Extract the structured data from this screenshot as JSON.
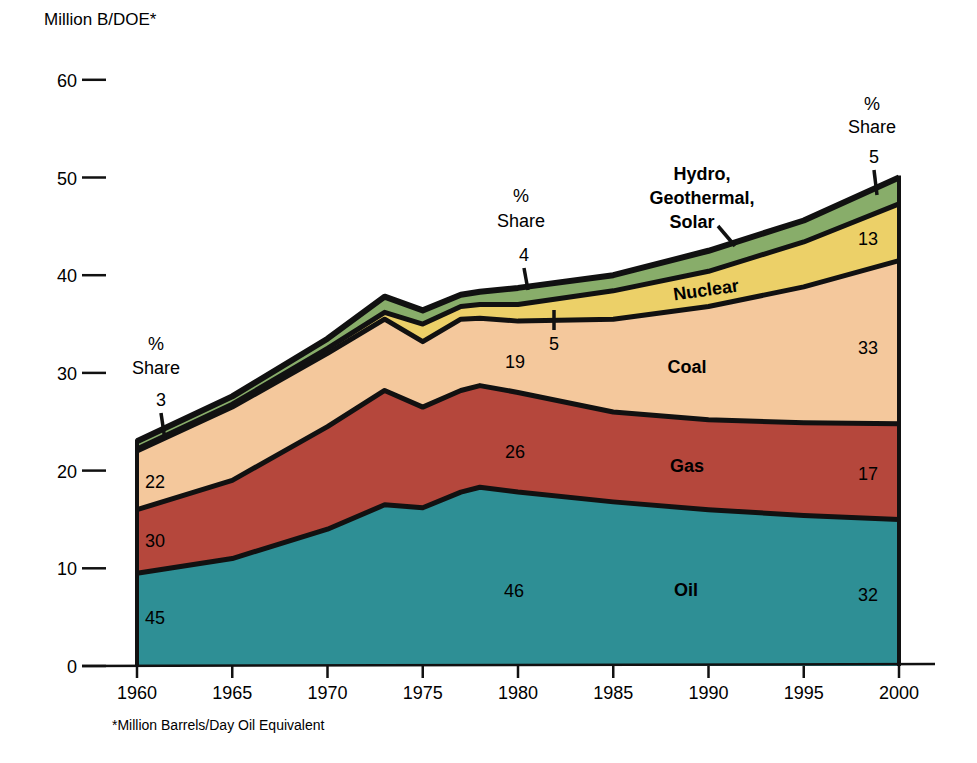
{
  "chart_data": {
    "type": "area",
    "stacked": true,
    "title": "",
    "ylabel": "Million B/DOE*",
    "xlabel": "",
    "footnote": "*Million Barrels/Day Oil Equivalent",
    "xlim": [
      1960,
      2000
    ],
    "ylim": [
      0,
      60
    ],
    "x_ticks": [
      1960,
      1965,
      1970,
      1975,
      1980,
      1985,
      1990,
      1995,
      2000
    ],
    "y_ticks": [
      0,
      10,
      20,
      30,
      40,
      50,
      60
    ],
    "grid": false,
    "x": [
      1960,
      1965,
      1970,
      1973,
      1975,
      1977,
      1978,
      1980,
      1985,
      1990,
      1995,
      2000
    ],
    "series": [
      {
        "name": "Oil",
        "color": "#2e8f95",
        "cumulative_top": [
          9.5,
          11,
          14,
          16.5,
          16.2,
          17.8,
          18.3,
          17.8,
          16.8,
          16.0,
          15.4,
          15.0
        ]
      },
      {
        "name": "Gas",
        "color": "#b5473c",
        "cumulative_top": [
          16,
          19,
          24.5,
          28.2,
          26.5,
          28.2,
          28.7,
          28.0,
          26.0,
          25.2,
          24.9,
          24.8
        ]
      },
      {
        "name": "Coal",
        "color": "#f4c89c",
        "cumulative_top": [
          22,
          26.5,
          32,
          35.5,
          33.2,
          35.5,
          35.6,
          35.3,
          35.5,
          36.8,
          38.8,
          41.5
        ]
      },
      {
        "name": "Nuclear",
        "color": "#ecd068",
        "cumulative_top": [
          22.2,
          26.8,
          32.5,
          36.2,
          35.0,
          36.8,
          37.0,
          37.0,
          38.4,
          40.4,
          43.4,
          47.3
        ]
      },
      {
        "name": "Hydro, Geothermal, Solar",
        "color": "#88ad6a",
        "cumulative_top": [
          23,
          27.6,
          33.5,
          37.8,
          36.4,
          38.0,
          38.3,
          38.7,
          40.0,
          42.5,
          45.6,
          50.0
        ]
      }
    ],
    "percent_share": {
      "1960": {
        "Oil": 45,
        "Gas": 30,
        "Coal": 22,
        "Hydro, Geothermal, Solar": 3
      },
      "1980": {
        "Oil": 46,
        "Gas": 26,
        "Coal": 19,
        "Nuclear": 5,
        "Hydro, Geothermal, Solar": 4
      },
      "2000": {
        "Oil": 32,
        "Gas": 17,
        "Coal": 33,
        "Nuclear": 13,
        "Hydro, Geothermal, Solar": 5
      }
    },
    "annotations": {
      "share_heading_1": "%",
      "share_heading_2": "Share",
      "series_labels": [
        "Oil",
        "Gas",
        "Coal",
        "Nuclear",
        "Hydro,",
        "Geothermal,",
        "Solar"
      ]
    }
  }
}
